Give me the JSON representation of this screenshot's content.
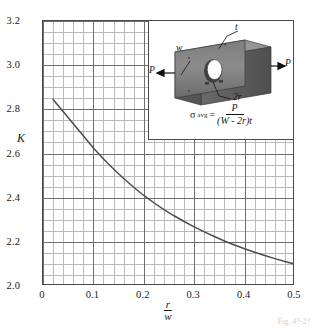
{
  "figure": {
    "caption": "Fig. 4?-2?"
  },
  "axes": {
    "y_title": "K",
    "x_title_numerator": "r",
    "x_title_denominator": "w",
    "y_ticks": [
      "2.0",
      "2.2",
      "2.4",
      "2.6",
      "2.8",
      "3.0",
      "3.2"
    ],
    "x_ticks": [
      "0",
      "0.1",
      "0.2",
      "0.3",
      "0.4",
      "0.5"
    ]
  },
  "inset": {
    "label_w": "w",
    "label_t": "t",
    "label_2r": "2r",
    "label_P_left": "P",
    "label_P_right": "P",
    "formula_symbol": "σ",
    "formula_subscript": "avg",
    "formula_equals": "=",
    "formula_numerator": "P",
    "formula_denominator": "(W - 2r)t"
  },
  "chart_data": {
    "type": "line",
    "title": "",
    "xlabel": "r/w",
    "ylabel": "K",
    "xlim": [
      0.0,
      0.5
    ],
    "ylim": [
      2.0,
      3.2
    ],
    "grid": true,
    "legend": false,
    "x_major_step": 0.1,
    "x_minor_step": 0.02,
    "y_major_step": 0.2,
    "y_minor_step": 0.05,
    "series": [
      {
        "name": "Stress concentration factor K",
        "x": [
          0.02,
          0.04,
          0.06,
          0.08,
          0.1,
          0.12,
          0.14,
          0.16,
          0.18,
          0.2,
          0.22,
          0.24,
          0.26,
          0.28,
          0.3,
          0.32,
          0.34,
          0.36,
          0.38,
          0.4,
          0.42,
          0.44,
          0.46,
          0.48,
          0.5
        ],
        "y": [
          2.845,
          2.79,
          2.735,
          2.68,
          2.625,
          2.575,
          2.53,
          2.487,
          2.447,
          2.41,
          2.377,
          2.346,
          2.318,
          2.292,
          2.268,
          2.245,
          2.224,
          2.204,
          2.186,
          2.169,
          2.153,
          2.138,
          2.124,
          2.111,
          2.099
        ]
      }
    ]
  }
}
